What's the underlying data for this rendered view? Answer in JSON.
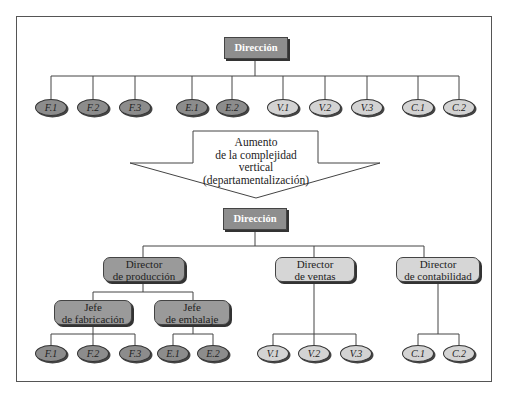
{
  "top_chart": {
    "root": {
      "label": "Dirección"
    },
    "units": [
      {
        "label": "F.1",
        "group": "fabricacion",
        "shade": "dark"
      },
      {
        "label": "F.2",
        "group": "fabricacion",
        "shade": "dark"
      },
      {
        "label": "F.3",
        "group": "fabricacion",
        "shade": "dark"
      },
      {
        "label": "E.1",
        "group": "embalaje",
        "shade": "dark"
      },
      {
        "label": "E.2",
        "group": "embalaje",
        "shade": "dark"
      },
      {
        "label": "V.1",
        "group": "ventas",
        "shade": "light"
      },
      {
        "label": "V.2",
        "group": "ventas",
        "shade": "light"
      },
      {
        "label": "V.3",
        "group": "ventas",
        "shade": "light"
      },
      {
        "label": "C.1",
        "group": "contabilidad",
        "shade": "light"
      },
      {
        "label": "C.2",
        "group": "contabilidad",
        "shade": "light"
      }
    ]
  },
  "arrow": {
    "lines": [
      "Aumento",
      "de la complejidad",
      "vertical",
      "(departamentalización)"
    ]
  },
  "bottom_chart": {
    "root": {
      "label": "Dirección"
    },
    "directors": [
      {
        "lines": [
          "Director",
          "de producción"
        ],
        "shade": "dark"
      },
      {
        "lines": [
          "Director",
          "de ventas"
        ],
        "shade": "light"
      },
      {
        "lines": [
          "Director",
          "de contabilidad"
        ],
        "shade": "light"
      }
    ],
    "chiefs": [
      {
        "lines": [
          "Jefe",
          "de fabricación"
        ],
        "shade": "dark"
      },
      {
        "lines": [
          "Jefe",
          "de embalaje"
        ],
        "shade": "dark"
      }
    ],
    "units": {
      "fabricacion": [
        "F.1",
        "F.2",
        "F.3"
      ],
      "embalaje": [
        "E.1",
        "E.2"
      ],
      "ventas": [
        "V.1",
        "V.2",
        "V.3"
      ],
      "contabilidad": [
        "C.1",
        "C.2"
      ]
    }
  },
  "colors": {
    "dark_fill": "#8c8c8c",
    "light_fill": "#d3d3d3",
    "line": "#444444",
    "root_fill": "#8e8e8e"
  }
}
